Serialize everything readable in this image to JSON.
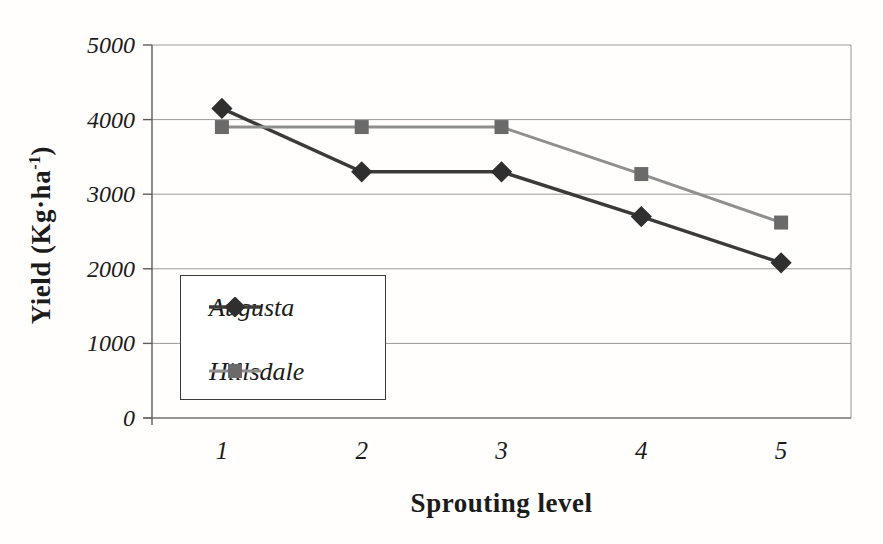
{
  "figure": {
    "background": "#fffefd",
    "text_color": "#1b1b1b"
  },
  "chart_data": {
    "type": "line",
    "title": "",
    "xlabel": "Sprouting level",
    "ylabel": "Yield (Kg·ha⁻¹)",
    "x_axis_type": "category",
    "categories": [
      "1",
      "2",
      "3",
      "4",
      "5"
    ],
    "series": [
      {
        "name": "Augusta",
        "marker": "diamond",
        "values": [
          4150,
          3300,
          3300,
          2700,
          2080
        ],
        "line_color": "#3a3a3a",
        "marker_color": "#2f2f2f",
        "line_width": 3.4,
        "marker_size": 15
      },
      {
        "name": "Hillsdale",
        "marker": "square",
        "values": [
          3900,
          3900,
          3900,
          3270,
          2620
        ],
        "line_color": "#8f8f8f",
        "marker_color": "#6a6a6a",
        "line_width": 3,
        "marker_size": 14
      }
    ],
    "ylim": [
      0,
      5000
    ],
    "yticks": [
      0,
      1000,
      2000,
      3000,
      4000,
      5000
    ],
    "grid": "horizontal",
    "gridline_color": "#9a9a9a",
    "axis_color": "#5c5c5c",
    "legend_position": "inside-left",
    "legend_border_color": "#3a3a3a"
  }
}
